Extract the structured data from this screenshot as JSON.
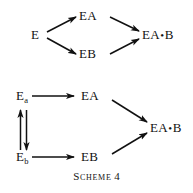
{
  "figure": {
    "caption_label": "Scheme",
    "caption_number": "4",
    "ink_color": "#111111",
    "background_color": "#ffffff"
  },
  "scheme_top": {
    "nodes": {
      "enzyme": "E",
      "ea": "EA",
      "eb": "EB",
      "product": "EA",
      "product_suffix": "B",
      "product_dot": "•"
    },
    "arrows": [
      {
        "name": "e-to-ea",
        "from": "E",
        "to": "EA",
        "direction": "up-right"
      },
      {
        "name": "e-to-eb",
        "from": "E",
        "to": "EB",
        "direction": "down-right"
      },
      {
        "name": "ea-to-product",
        "from": "EA",
        "to": "EA•B",
        "direction": "down-right"
      },
      {
        "name": "eb-to-product",
        "from": "EB",
        "to": "EA•B",
        "direction": "up-right"
      }
    ]
  },
  "scheme_bottom": {
    "nodes": {
      "ea_enzyme_base": "E",
      "ea_enzyme_sub": "a",
      "eb_enzyme_base": "E",
      "eb_enzyme_sub": "b",
      "ea": "EA",
      "eb": "EB",
      "product": "EA",
      "product_suffix": "B",
      "product_dot": "•"
    },
    "arrows": [
      {
        "name": "ea-enzyme-to-ea",
        "from": "Ea",
        "to": "EA",
        "direction": "right"
      },
      {
        "name": "eb-enzyme-to-eb",
        "from": "Eb",
        "to": "EB",
        "direction": "right"
      },
      {
        "name": "enzyme-equilibrium",
        "from": "Ea",
        "to": "Eb",
        "direction": "vertical-equilibrium"
      },
      {
        "name": "ea-to-product",
        "from": "EA",
        "to": "EA•B",
        "direction": "down-right"
      },
      {
        "name": "eb-to-product",
        "from": "EB",
        "to": "EA•B",
        "direction": "up-right"
      }
    ]
  }
}
